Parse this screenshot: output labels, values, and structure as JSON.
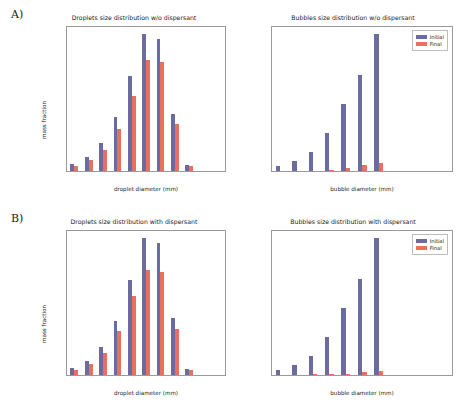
{
  "figure": {
    "panels": [
      {
        "letter": "A)"
      },
      {
        "letter": "B)"
      }
    ],
    "legend": {
      "initial_label": "Initial",
      "final_label": "Final",
      "initial_color": "#6B6BA0",
      "final_color": "#E8705C"
    }
  },
  "chart_data": [
    {
      "type": "bar",
      "panel": "A",
      "position": "top-left",
      "title": "Droplets size distribution w/o dispersant",
      "xlabel": "droplet diameter (mm)",
      "ylabel": "mass fraction",
      "categories": [
        "0.54",
        "0.82",
        "1.24",
        "1.89",
        "2.88",
        "4.38",
        "6.66",
        "10.12",
        "15.38",
        "23.38",
        "35.54"
      ],
      "series": [
        {
          "name": "Initial",
          "color": "#6B6BA0",
          "values": [
            0.013,
            0.026,
            0.052,
            0.101,
            0.178,
            0.257,
            0.247,
            0.107,
            0.012,
            0.0,
            0.0
          ]
        },
        {
          "name": "Final",
          "color": "#E8705C",
          "values": [
            0.01,
            0.021,
            0.04,
            0.078,
            0.14,
            0.209,
            0.205,
            0.089,
            0.01,
            0.0,
            0.0
          ]
        }
      ],
      "yticks": [
        "0.00",
        "0.02",
        "0.04",
        "0.06",
        "0.08",
        "0.10",
        "0.12",
        "0.14",
        "0.16",
        "0.18",
        "0.20",
        "0.22",
        "0.24",
        "0.26"
      ],
      "ylim": [
        0,
        0.27
      ],
      "grid": false,
      "legend_position": "none"
    },
    {
      "type": "bar",
      "panel": "A",
      "position": "top-right",
      "title": "Bubbles size distribution w/o dispersant",
      "xlabel": "bubble diameter (mm)",
      "ylabel": "",
      "categories": [
        "1.34",
        "2.03",
        "3.09",
        "4.71",
        "7.16",
        "10.88",
        "16.55",
        "25.14",
        "38.21",
        "58.07",
        "88.27"
      ],
      "series": [
        {
          "name": "Initial",
          "color": "#6B6BA0",
          "values": [
            0.013,
            0.026,
            0.052,
            0.101,
            0.178,
            0.257,
            0.366,
            0.0,
            0.0,
            0.0,
            0.0
          ]
        },
        {
          "name": "Final",
          "color": "#E8705C",
          "values": [
            0.0,
            0.0,
            0.001,
            0.003,
            0.009,
            0.016,
            0.022,
            0.0,
            0.0,
            0.0,
            0.0
          ]
        }
      ],
      "yticks": [
        "0.00",
        "0.02",
        "0.04",
        "0.06",
        "0.08",
        "0.10",
        "0.12",
        "0.14",
        "0.16",
        "0.18",
        "0.20",
        "0.22",
        "0.24",
        "0.26",
        "0.28",
        "0.30",
        "0.32",
        "0.34",
        "0.36",
        "0.38"
      ],
      "ylim": [
        0,
        0.385
      ],
      "grid": false,
      "legend_position": "upper-right"
    },
    {
      "type": "bar",
      "panel": "B",
      "position": "bottom-left",
      "title": "Droplets size distribution with dispersant",
      "xlabel": "droplet diameter (mm)",
      "ylabel": "mass fraction",
      "categories": [
        "0.2",
        "0.3",
        "0.46",
        "0.7",
        "1.07",
        "1.63",
        "2.47",
        "3.76",
        "5.72",
        "8.7",
        "13.22"
      ],
      "series": [
        {
          "name": "Initial",
          "color": "#6B6BA0",
          "values": [
            0.013,
            0.026,
            0.052,
            0.101,
            0.178,
            0.257,
            0.247,
            0.107,
            0.012,
            0.0,
            0.0
          ]
        },
        {
          "name": "Final",
          "color": "#E8705C",
          "values": [
            0.01,
            0.021,
            0.042,
            0.083,
            0.148,
            0.197,
            0.194,
            0.086,
            0.009,
            0.0,
            0.0
          ]
        }
      ],
      "yticks": [
        "0.00",
        "0.02",
        "0.04",
        "0.06",
        "0.08",
        "0.10",
        "0.12",
        "0.14",
        "0.16",
        "0.18",
        "0.20",
        "0.22",
        "0.24",
        "0.26"
      ],
      "ylim": [
        0,
        0.27
      ],
      "grid": false,
      "legend_position": "none"
    },
    {
      "type": "bar",
      "panel": "B",
      "position": "bottom-right",
      "title": "Bubbles size distribution with dispersant",
      "xlabel": "bubble diameter (mm)",
      "ylabel": "",
      "categories": [
        "0.57",
        "0.87",
        "1.33",
        "2.02",
        "3.06",
        "4.68",
        "7.11",
        "10.81",
        "16.44",
        "24.99",
        "37.98"
      ],
      "series": [
        {
          "name": "Initial",
          "color": "#6B6BA0",
          "values": [
            0.013,
            0.026,
            0.052,
            0.101,
            0.178,
            0.257,
            0.366,
            0.0,
            0.0,
            0.0,
            0.0
          ]
        },
        {
          "name": "Final",
          "color": "#E8705C",
          "values": [
            0.0,
            0.0,
            0.002,
            0.003,
            0.004,
            0.009,
            0.012,
            0.0,
            0.0,
            0.0,
            0.0
          ]
        }
      ],
      "yticks": [
        "0.00",
        "0.02",
        "0.04",
        "0.06",
        "0.08",
        "0.10",
        "0.12",
        "0.14",
        "0.16",
        "0.18",
        "0.20",
        "0.22",
        "0.24",
        "0.26",
        "0.28",
        "0.30",
        "0.32",
        "0.34",
        "0.36",
        "0.38"
      ],
      "ylim": [
        0,
        0.385
      ],
      "grid": false,
      "legend_position": "upper-right"
    }
  ]
}
